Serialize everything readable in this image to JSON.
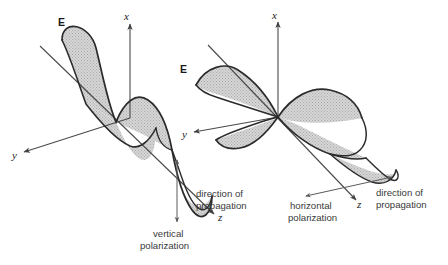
{
  "figure": {
    "background_color": "#ffffff",
    "line_color": "#3f3f3f",
    "wave_stroke_color": "#2b2b2b",
    "wave_fill_color": "#cccccc"
  },
  "left_diagram": {
    "name": "vertical-polarization-diagram",
    "field_label": "E",
    "axis_x_label": "x",
    "axis_y_label": "y",
    "axis_z_label": "z",
    "direction_label_line1": "direction of",
    "direction_label_line2": "propagation",
    "polarization_label_line1": "vertical",
    "polarization_label_line2": "polarization"
  },
  "right_diagram": {
    "name": "horizontal-polarization-diagram",
    "field_label": "E",
    "axis_x_label": "x",
    "axis_y_label": "y",
    "axis_z_label": "z",
    "direction_label_line1": "direction of",
    "direction_label_line2": "propagation",
    "polarization_label_line1": "horizontal",
    "polarization_label_line2": "polarization"
  }
}
